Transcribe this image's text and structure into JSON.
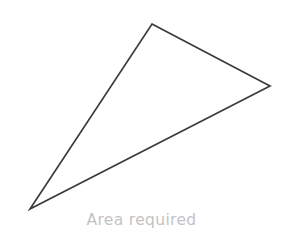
{
  "canvas": {
    "width": 283,
    "height": 247,
    "background_color": "#ffffff"
  },
  "figure": {
    "type": "triangle",
    "name": "area-required-triangle",
    "stroke_color": "#3b3b3b",
    "stroke_width": 1.7,
    "fill": "none",
    "vertices": [
      {
        "label": "top",
        "x": 152,
        "y": 24
      },
      {
        "label": "right",
        "x": 270,
        "y": 86
      },
      {
        "label": "bottom-left",
        "x": 30,
        "y": 209
      }
    ],
    "points_attribute": "152,24 270,86 30,209"
  },
  "caption": {
    "text": "Area required",
    "color": "#c3c3c3"
  }
}
